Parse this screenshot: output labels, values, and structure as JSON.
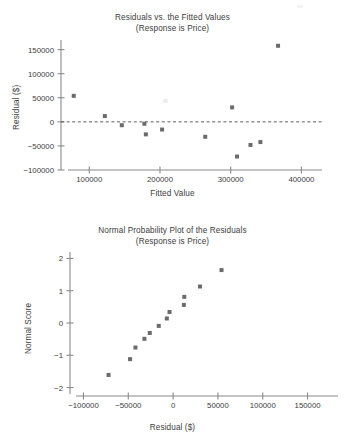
{
  "page": {
    "width": 345,
    "height": 446,
    "background": "#ffffff",
    "marker_color": "#6b6b6b",
    "axis_color": "#8a8a8a",
    "text_color": "#3d3d3d"
  },
  "figure1": {
    "name": "residuals-vs-fitted-plot",
    "title_lines": [
      "Residuals vs. the Fitted Values",
      "(Response is Price)"
    ],
    "chart_data": {
      "type": "scatter",
      "title": "Residuals vs. the Fitted Values (Response is Price)",
      "subtitle": "(Response is Price)",
      "xlabel": "Fitted Value",
      "ylabel": "Residual ($)",
      "xlim": [
        60000,
        415000
      ],
      "ylim": [
        -100000,
        170000
      ],
      "xticks": [
        100000,
        200000,
        300000,
        400000
      ],
      "xticklabels": [
        "100000",
        "200000",
        "300000",
        "400000"
      ],
      "yticks": [
        150000,
        100000,
        50000,
        0,
        -50000,
        -100000
      ],
      "yticklabels": [
        "150000",
        "100000",
        "50000",
        "0",
        "-50000",
        "-100000"
      ],
      "grid": false,
      "legend": null,
      "reference_line": {
        "type": "horizontal-dashed",
        "y": 0
      },
      "points": [
        {
          "x": 78000,
          "y": 54000
        },
        {
          "x": 122000,
          "y": 12000
        },
        {
          "x": 146000,
          "y": -7000
        },
        {
          "x": 178000,
          "y": -4000
        },
        {
          "x": 180000,
          "y": -26000
        },
        {
          "x": 203000,
          "y": -16000
        },
        {
          "x": 264000,
          "y": -31000
        },
        {
          "x": 302000,
          "y": 30000
        },
        {
          "x": 309000,
          "y": -72000
        },
        {
          "x": 328000,
          "y": -48000
        },
        {
          "x": 342000,
          "y": -42000
        },
        {
          "x": 367000,
          "y": 158000
        }
      ]
    }
  },
  "figure2": {
    "name": "normal-probability-plot",
    "title_lines": [
      "Normal Probability Plot of the Residuals",
      "(Response is Price)"
    ],
    "chart_data": {
      "type": "scatter",
      "title": "Normal Probability Plot of the Residuals (Response is Price)",
      "subtitle": "(Response is Price)",
      "xlabel": "Residual ($)",
      "ylabel": "Normal Score",
      "xlim": [
        -115000,
        175000
      ],
      "ylim": [
        -2.2,
        2.2
      ],
      "xticks": [
        -100000,
        -50000,
        0,
        50000,
        100000,
        150000
      ],
      "xticklabels": [
        "-100000",
        "-50000",
        "0",
        "50000",
        "100000",
        "150000"
      ],
      "yticks": [
        2,
        1,
        0,
        -1,
        -2
      ],
      "yticklabels": [
        "2",
        "1",
        "0",
        "-1",
        "-2"
      ],
      "grid": false,
      "legend": null,
      "points": [
        {
          "x": -72000,
          "y": -1.61
        },
        {
          "x": -48000,
          "y": -1.12
        },
        {
          "x": -42000,
          "y": -0.76
        },
        {
          "x": -32000,
          "y": -0.49
        },
        {
          "x": -26000,
          "y": -0.31
        },
        {
          "x": -16000,
          "y": -0.09
        },
        {
          "x": -7000,
          "y": 0.14
        },
        {
          "x": -4000,
          "y": 0.34
        },
        {
          "x": 12000,
          "y": 0.56
        },
        {
          "x": 12500,
          "y": 0.81
        },
        {
          "x": 30000,
          "y": 1.13
        },
        {
          "x": 54000,
          "y": 1.64
        }
      ]
    }
  }
}
